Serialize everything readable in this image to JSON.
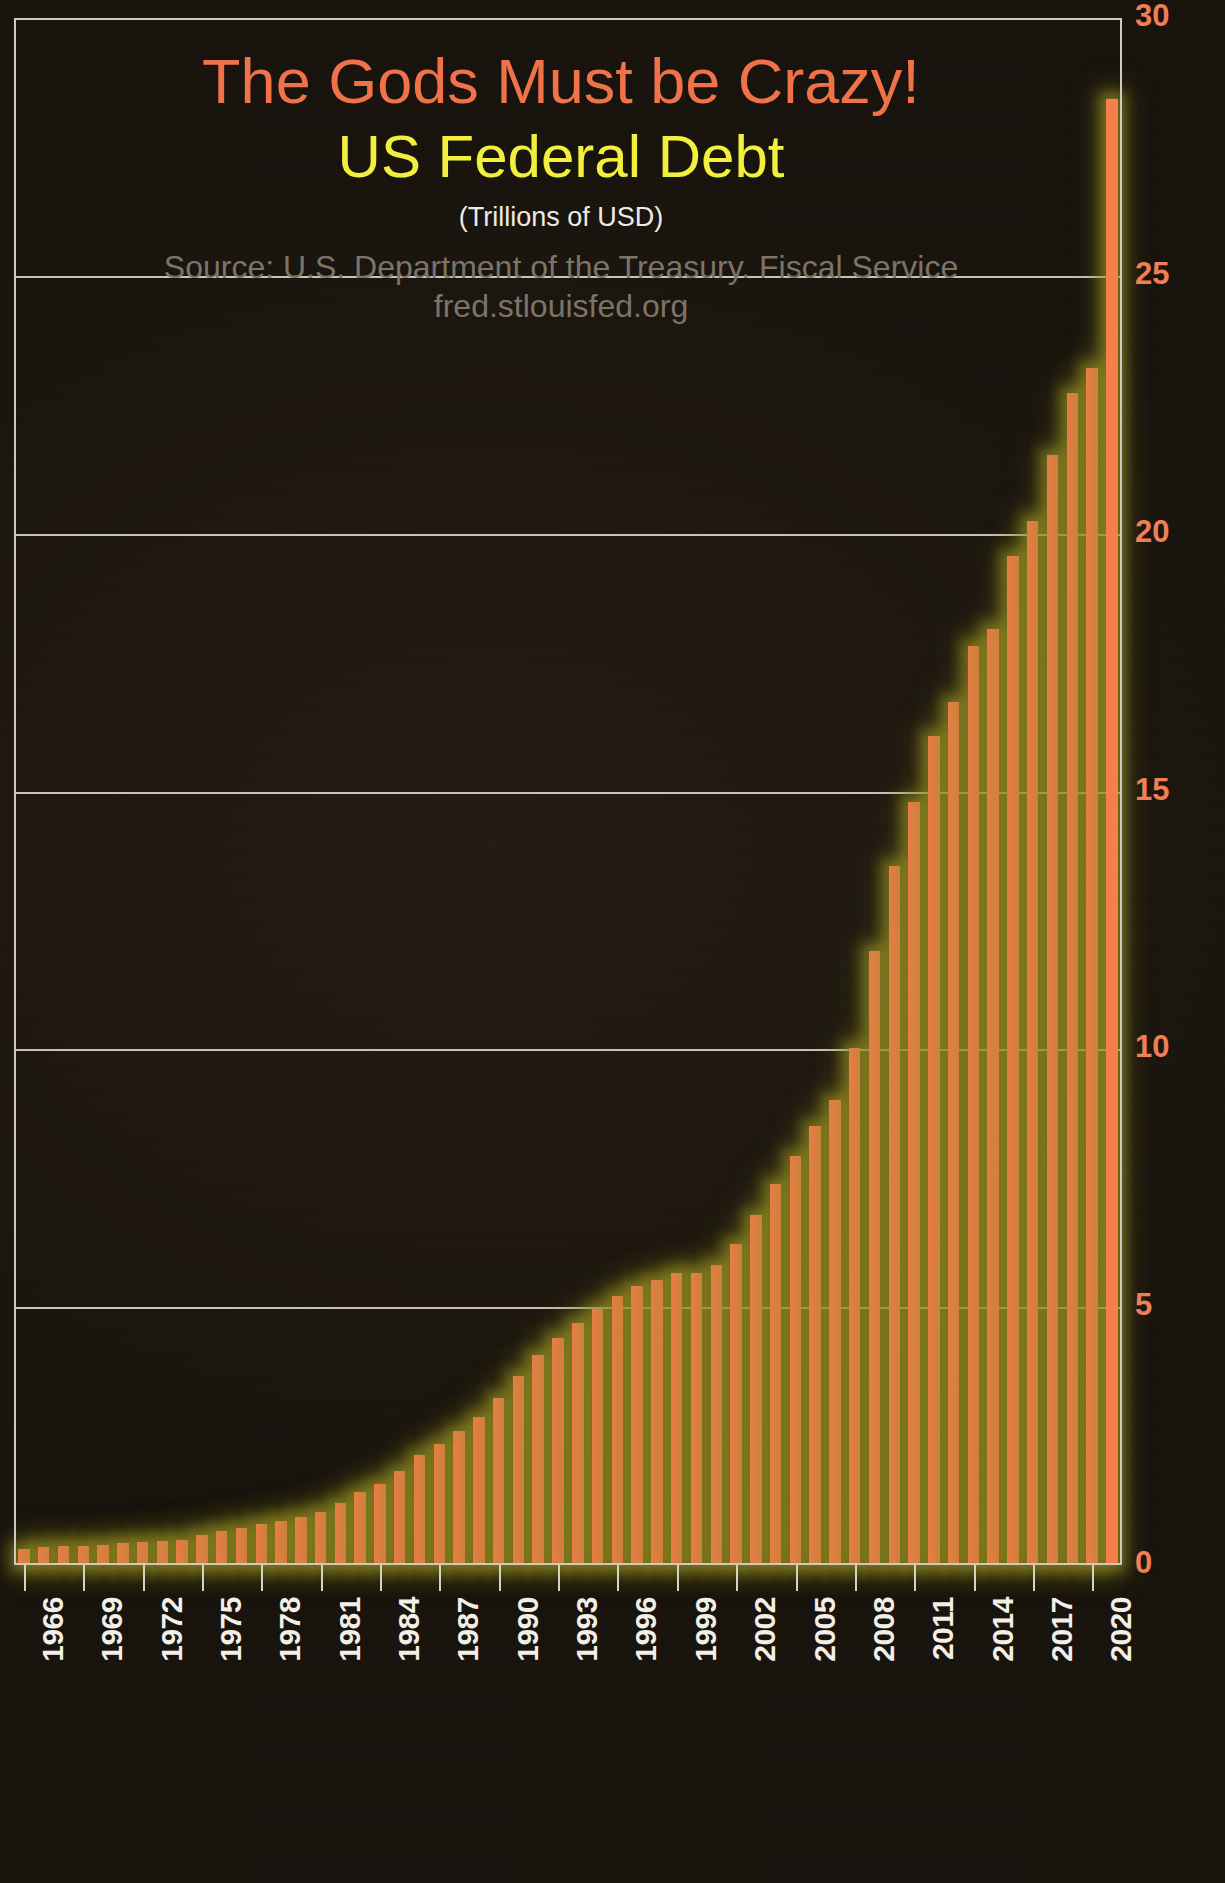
{
  "titles": {
    "main": "The Gods Must be Crazy!",
    "sub": "US Federal Debt",
    "units": "(Trillions of USD)",
    "source": "Source: U.S. Department of the Treasury. Fiscal Service",
    "url": "fred.stlouisfed.org"
  },
  "colors": {
    "title": "#ef7249",
    "subtitle": "#f2f03c",
    "units": "#efeae2",
    "source": "#7d7468",
    "bar": "#f4804c",
    "bar_glow": "#a8a028",
    "gridline": "#d8d2c6",
    "y_label": "#ef7f55",
    "x_label": "#f2efe9",
    "background": "#1f1910"
  },
  "chart_data": {
    "type": "bar",
    "title": "The Gods Must be Crazy! US Federal Debt",
    "subtitle": "(Trillions of USD)",
    "xlabel": "",
    "ylabel": "",
    "ylim": [
      0,
      30
    ],
    "yticks": [
      0,
      5,
      10,
      15,
      20,
      25,
      30
    ],
    "ytick_labels": [
      "0",
      "5",
      "10",
      "15",
      "20",
      "25",
      "30"
    ],
    "grid": true,
    "grid_axis": "y",
    "legend": false,
    "xtick_labels": [
      "1966",
      "1969",
      "1972",
      "1975",
      "1978",
      "1981",
      "1984",
      "1987",
      "1990",
      "1993",
      "1996",
      "1999",
      "2002",
      "2005",
      "2008",
      "2011",
      "2014",
      "2017",
      "2020"
    ],
    "xtick_step_years": 3,
    "categories": [
      "1966",
      "1967",
      "1968",
      "1969",
      "1970",
      "1971",
      "1972",
      "1973",
      "1974",
      "1975",
      "1976",
      "1977",
      "1978",
      "1979",
      "1980",
      "1981",
      "1982",
      "1983",
      "1984",
      "1985",
      "1986",
      "1987",
      "1988",
      "1989",
      "1990",
      "1991",
      "1992",
      "1993",
      "1994",
      "1995",
      "1996",
      "1997",
      "1998",
      "1999",
      "2000",
      "2001",
      "2002",
      "2003",
      "2004",
      "2005",
      "2006",
      "2007",
      "2008",
      "2009",
      "2010",
      "2011",
      "2012",
      "2013",
      "2014",
      "2015",
      "2016",
      "2017",
      "2018",
      "2019",
      "2020",
      "2021"
    ],
    "values": [
      0.32,
      0.34,
      0.37,
      0.37,
      0.39,
      0.42,
      0.45,
      0.47,
      0.49,
      0.58,
      0.66,
      0.72,
      0.79,
      0.85,
      0.93,
      1.03,
      1.2,
      1.41,
      1.58,
      1.83,
      2.13,
      2.35,
      2.6,
      2.87,
      3.23,
      3.67,
      4.07,
      4.41,
      4.7,
      4.97,
      5.22,
      5.41,
      5.53,
      5.66,
      5.67,
      5.81,
      6.23,
      6.78,
      7.38,
      7.93,
      8.51,
      9.01,
      10.02,
      11.91,
      13.56,
      14.79,
      16.07,
      16.74,
      17.82,
      18.15,
      19.57,
      20.24,
      21.52,
      22.72,
      23.22,
      28.43
    ]
  }
}
